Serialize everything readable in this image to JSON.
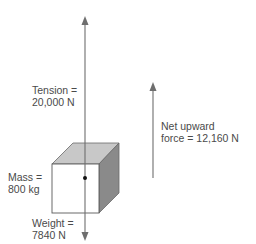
{
  "diagram": {
    "type": "free-body diagram",
    "colors": {
      "line": "#6e6e6e",
      "text": "#4a4a4a",
      "cube_front": "#ffffff",
      "cube_top": "#c8c8c8",
      "cube_side": "#8a8a8a",
      "cube_edge": "#5a5a5a",
      "dot": "#111111"
    },
    "labels": {
      "tension": {
        "line1": "Tension =",
        "line2": "20,000 N"
      },
      "mass": {
        "line1": "Mass =",
        "line2": "800 kg"
      },
      "weight": {
        "line1": "Weight =",
        "line2": "7840 N"
      },
      "net_force": {
        "line1": "Net upward",
        "line2": "force = 12,160 N"
      }
    },
    "forces": [
      {
        "name": "Tension",
        "value": "20,000 N",
        "direction": "up"
      },
      {
        "name": "Weight",
        "value": "7840 N",
        "direction": "down"
      },
      {
        "name": "Net upward force",
        "value": "12,160 N",
        "direction": "up"
      }
    ],
    "object": {
      "name": "Mass",
      "value": "800 kg",
      "shape": "cube"
    }
  }
}
